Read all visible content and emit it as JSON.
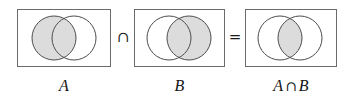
{
  "figure": {
    "kind": "venn-diagram-identity",
    "statement": "A ∩ B",
    "background_color": "#ffffff",
    "shade_color": "#dcdcdc",
    "stroke_color": "#6b6b6b",
    "text_color": "#151515"
  },
  "operators": [
    {
      "name": "intersection",
      "symbol": "∩"
    },
    {
      "name": "equals",
      "symbol": "="
    }
  ],
  "panels": [
    {
      "id": "panel-a",
      "caption_parts": [
        {
          "text": "A",
          "style": "var"
        }
      ],
      "caption_text": "A",
      "shaded_region": "left-circle",
      "left_circle_label": "A",
      "right_circle_label": "B"
    },
    {
      "id": "panel-b",
      "caption_parts": [
        {
          "text": "B",
          "style": "var"
        }
      ],
      "caption_text": "B",
      "shaded_region": "right-circle",
      "left_circle_label": "A",
      "right_circle_label": "B"
    },
    {
      "id": "panel-a-intersect-b",
      "caption_parts": [
        {
          "text": "A",
          "style": "var"
        },
        {
          "text": "∩",
          "style": "cap-sym"
        },
        {
          "text": "B",
          "style": "var"
        }
      ],
      "caption_text": "A ∩ B",
      "shaded_region": "intersection-lens",
      "left_circle_label": "A",
      "right_circle_label": "B"
    }
  ]
}
